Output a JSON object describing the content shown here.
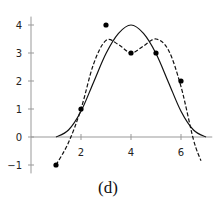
{
  "chart_data": {
    "type": "line",
    "title": "",
    "caption": "(d)",
    "xlabel": "",
    "ylabel": "",
    "xlim": [
      0,
      7.2
    ],
    "ylim": [
      -1.2,
      4.3
    ],
    "grid": false,
    "x_ticks": [
      2,
      4,
      6
    ],
    "y_ticks": [
      -1,
      0,
      1,
      2,
      3,
      4
    ],
    "x_tick_labels": [
      "2",
      "4",
      "6"
    ],
    "y_tick_labels": [
      "−1",
      "0",
      "1",
      "2",
      "3",
      "4"
    ],
    "scatter_points": [
      {
        "x": 1,
        "y": -1
      },
      {
        "x": 2,
        "y": 1
      },
      {
        "x": 3,
        "y": 4
      },
      {
        "x": 4,
        "y": 3
      },
      {
        "x": 5,
        "y": 3
      },
      {
        "x": 6,
        "y": 2
      }
    ],
    "series": [
      {
        "name": "solid-curve",
        "style": "solid",
        "x": [
          1,
          1.5,
          2,
          2.5,
          3,
          3.5,
          4,
          4.5,
          5,
          5.5,
          6,
          6.5,
          7
        ],
        "y": [
          0,
          0.25,
          0.92,
          1.95,
          2.98,
          3.7,
          4,
          3.7,
          2.98,
          1.95,
          0.92,
          0.25,
          0
        ]
      },
      {
        "name": "dashed-curve",
        "style": "dashed",
        "x": [
          1,
          1.5,
          2,
          2.5,
          3,
          3.5,
          4,
          4.5,
          5,
          5.5,
          6,
          6.5,
          6.8
        ],
        "y": [
          -1,
          -0.2,
          1,
          2.6,
          3.45,
          3.3,
          3,
          3.25,
          3.5,
          3.1,
          1.8,
          -0.1,
          -0.85
        ]
      }
    ]
  }
}
